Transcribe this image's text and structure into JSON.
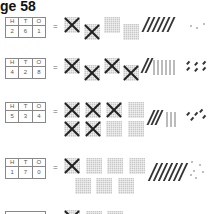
{
  "page": {
    "title": "ge 58"
  },
  "columns": [
    "H",
    "T",
    "O"
  ],
  "rows": [
    {
      "h": "2",
      "t": "6",
      "o": "1",
      "equals": "=",
      "hundreds_crossed": 2,
      "hundreds_plain": 2,
      "tens": 6,
      "ones": 3
    },
    {
      "h": "4",
      "t": "2",
      "o": "8",
      "equals": "=",
      "hundreds_crossed": 4,
      "hundreds_plain": 0,
      "tens": 10,
      "ones": 6
    },
    {
      "h": "5",
      "t": "3",
      "o": "4",
      "equals": "=",
      "hundreds_crossed": 5,
      "hundreds_plain": 3,
      "tens": 6,
      "ones": 5
    },
    {
      "h": "1",
      "t": "7",
      "o": "0",
      "equals": "=",
      "hundreds_crossed": 1,
      "hundreds_plain": 6,
      "tens": 7,
      "ones": 6
    },
    {
      "h": "",
      "t": "",
      "o": "",
      "equals": "",
      "hundreds_crossed": 1,
      "hundreds_plain": 2,
      "tens": 0,
      "ones": 0
    }
  ]
}
